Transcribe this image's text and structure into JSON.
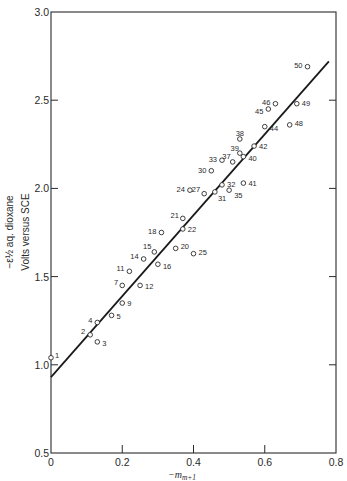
{
  "chart_data": {
    "type": "scatter",
    "title": "",
    "xlabel": "−m_{m+1}",
    "xlabel_main": "−m",
    "xlabel_sub": "m+1",
    "ylabel_line1": "−ε½ aq. dioxane",
    "ylabel_line2": "Volts versus SCE",
    "xlim": [
      0,
      0.8
    ],
    "ylim": [
      0.5,
      3.0
    ],
    "xticks": [
      0,
      0.2,
      0.4,
      0.6,
      0.8
    ],
    "xtick_labels": [
      "0",
      "0.2",
      "0.4",
      "0.6",
      "0.8"
    ],
    "yticks": [
      0.5,
      1.0,
      1.5,
      2.0,
      2.5,
      3.0
    ],
    "ytick_labels": [
      "0.5",
      "1.0",
      "1.5",
      "2.0",
      "2.5",
      "3.0"
    ],
    "grid": false,
    "legend": null,
    "marker": "open-circle",
    "fit_line": {
      "x": [
        0.0,
        0.78
      ],
      "y": [
        0.93,
        2.72
      ]
    },
    "points": [
      {
        "label": "1",
        "x": 0.0,
        "y": 1.04
      },
      {
        "label": "2",
        "x": 0.11,
        "y": 1.17
      },
      {
        "label": "3",
        "x": 0.13,
        "y": 1.13
      },
      {
        "label": "4",
        "x": 0.13,
        "y": 1.24
      },
      {
        "label": "5",
        "x": 0.17,
        "y": 1.28
      },
      {
        "label": "7",
        "x": 0.2,
        "y": 1.45
      },
      {
        "label": "9",
        "x": 0.2,
        "y": 1.35
      },
      {
        "label": "11",
        "x": 0.22,
        "y": 1.53
      },
      {
        "label": "12",
        "x": 0.25,
        "y": 1.45
      },
      {
        "label": "14",
        "x": 0.26,
        "y": 1.6
      },
      {
        "label": "15",
        "x": 0.29,
        "y": 1.64
      },
      {
        "label": "16",
        "x": 0.3,
        "y": 1.57
      },
      {
        "label": "18",
        "x": 0.31,
        "y": 1.75
      },
      {
        "label": "20",
        "x": 0.35,
        "y": 1.66
      },
      {
        "label": "21",
        "x": 0.37,
        "y": 1.83
      },
      {
        "label": "22",
        "x": 0.37,
        "y": 1.77
      },
      {
        "label": "24",
        "x": 0.39,
        "y": 1.99
      },
      {
        "label": "25",
        "x": 0.4,
        "y": 1.63
      },
      {
        "label": "27",
        "x": 0.43,
        "y": 1.97
      },
      {
        "label": "30",
        "x": 0.45,
        "y": 2.1
      },
      {
        "label": "31",
        "x": 0.46,
        "y": 1.98
      },
      {
        "label": "32",
        "x": 0.48,
        "y": 2.02
      },
      {
        "label": "33",
        "x": 0.48,
        "y": 2.16
      },
      {
        "label": "35",
        "x": 0.5,
        "y": 1.99
      },
      {
        "label": "37",
        "x": 0.51,
        "y": 2.15
      },
      {
        "label": "38",
        "x": 0.53,
        "y": 2.28
      },
      {
        "label": "39",
        "x": 0.53,
        "y": 2.2
      },
      {
        "label": "40",
        "x": 0.54,
        "y": 2.18
      },
      {
        "label": "41",
        "x": 0.54,
        "y": 2.03
      },
      {
        "label": "42",
        "x": 0.57,
        "y": 2.24
      },
      {
        "label": "44",
        "x": 0.6,
        "y": 2.35
      },
      {
        "label": "45",
        "x": 0.61,
        "y": 2.45
      },
      {
        "label": "46",
        "x": 0.63,
        "y": 2.48
      },
      {
        "label": "48",
        "x": 0.67,
        "y": 2.36
      },
      {
        "label": "49",
        "x": 0.69,
        "y": 2.48
      },
      {
        "label": "50",
        "x": 0.72,
        "y": 2.69
      }
    ],
    "label_offsets": {
      "1": [
        4,
        -2,
        "start"
      ],
      "2": [
        -5,
        -3,
        "end"
      ],
      "3": [
        5,
        2,
        "start"
      ],
      "4": [
        -5,
        -2,
        "end"
      ],
      "5": [
        5,
        1,
        "start"
      ],
      "7": [
        -4,
        -3,
        "end"
      ],
      "9": [
        5,
        0,
        "start"
      ],
      "11": [
        -5,
        -3,
        "end"
      ],
      "12": [
        5,
        1,
        "start"
      ],
      "14": [
        -5,
        -2,
        "end"
      ],
      "15": [
        -3,
        -5,
        "end"
      ],
      "16": [
        5,
        2,
        "start"
      ],
      "18": [
        -5,
        -1,
        "end"
      ],
      "20": [
        5,
        -2,
        "start"
      ],
      "21": [
        -4,
        -3,
        "end"
      ],
      "22": [
        5,
        1,
        "start"
      ],
      "24": [
        -5,
        -1,
        "end"
      ],
      "25": [
        5,
        -1,
        "start"
      ],
      "27": [
        -4,
        -4,
        "end"
      ],
      "30": [
        -5,
        0,
        "end"
      ],
      "31": [
        3,
        7,
        "start"
      ],
      "32": [
        5,
        0,
        "start"
      ],
      "33": [
        -5,
        -1,
        "end"
      ],
      "35": [
        5,
        5,
        "start"
      ],
      "37": [
        -2,
        -5,
        "end"
      ],
      "38": [
        0,
        -6,
        "middle"
      ],
      "39": [
        -1,
        -5,
        "end"
      ],
      "40": [
        5,
        2,
        "start"
      ],
      "41": [
        5,
        0,
        "start"
      ],
      "42": [
        5,
        0,
        "start"
      ],
      "44": [
        5,
        2,
        "start"
      ],
      "45": [
        -5,
        2,
        "end"
      ],
      "46": [
        -5,
        -1,
        "end"
      ],
      "48": [
        5,
        -1,
        "start"
      ],
      "49": [
        5,
        0,
        "start"
      ],
      "50": [
        -5,
        -1,
        "end"
      ]
    }
  },
  "colors": {
    "ink": "#2a2a2a",
    "background": "#ffffff"
  }
}
